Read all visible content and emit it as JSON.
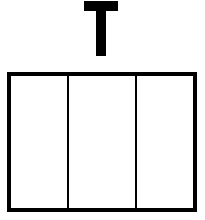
{
  "diagram": {
    "label": "T",
    "box": {
      "columns": 3,
      "sections": [
        {
          "index": 1,
          "label": ""
        },
        {
          "index": 2,
          "label": ""
        },
        {
          "index": 3,
          "label": ""
        }
      ]
    },
    "colors": {
      "stroke": "#000000",
      "background": "#ffffff"
    }
  }
}
